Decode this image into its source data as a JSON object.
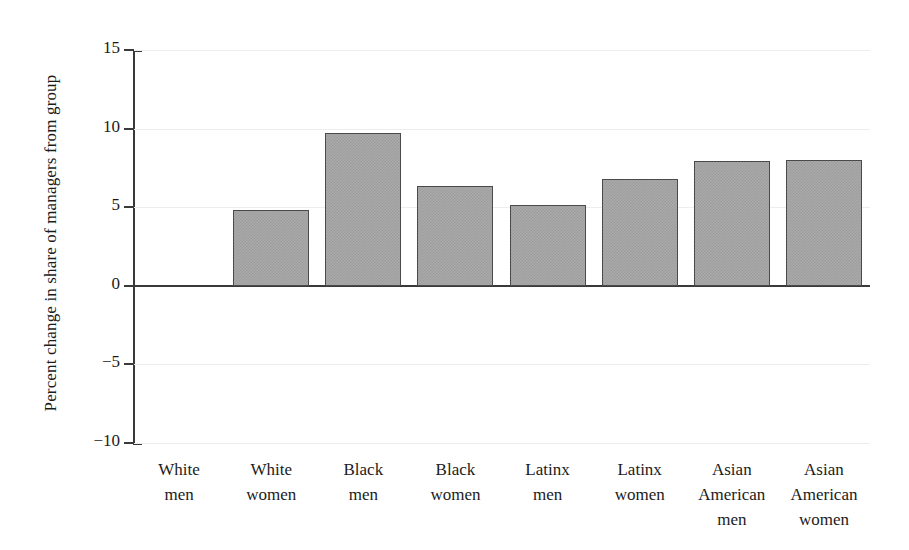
{
  "chart_data": {
    "type": "bar",
    "title": "",
    "xlabel": "",
    "ylabel": "Percent change in share of managers from group",
    "ylim": [
      -10,
      15
    ],
    "yticks": [
      15,
      10,
      5,
      0,
      -5,
      -10
    ],
    "ytick_labels": [
      "15",
      "10",
      "5",
      "0",
      "−5",
      "−10"
    ],
    "grid": true,
    "legend": "none",
    "categories": [
      "White men",
      "White women",
      "Black men",
      "Black women",
      "Latinx men",
      "Latinx women",
      "Asian American men",
      "Asian American women"
    ],
    "category_lines": [
      [
        "White",
        "men"
      ],
      [
        "White",
        "women"
      ],
      [
        "Black",
        "men"
      ],
      [
        "Black",
        "women"
      ],
      [
        "Latinx",
        "men"
      ],
      [
        "Latinx",
        "women"
      ],
      [
        "Asian",
        "American",
        "men"
      ],
      [
        "Asian",
        "American",
        "women"
      ]
    ],
    "values": [
      0,
      4.85,
      9.75,
      6.35,
      5.15,
      6.8,
      7.95,
      8.0
    ],
    "bar_fill_color": "#aaaaaa",
    "bar_border_color": "#4a4a4a",
    "axis_color": "#3a3a3a",
    "gridline_color": "#ededed",
    "background_color": "#ffffff"
  }
}
